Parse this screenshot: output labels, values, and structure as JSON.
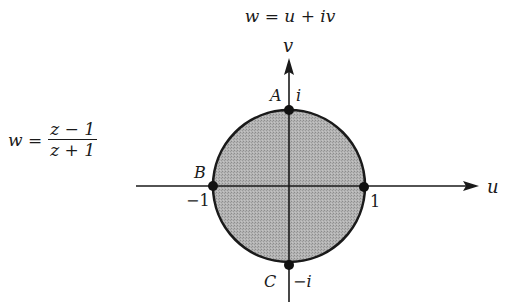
{
  "diagram": {
    "title": "w = u + iv",
    "mapping": {
      "lhs": "w =",
      "numerator": "z − 1",
      "denominator": "z + 1"
    },
    "axes": {
      "horizontal_label": "u",
      "vertical_label": "v"
    },
    "points": [
      {
        "name": "A",
        "value": "i",
        "position": "top"
      },
      {
        "name": "B",
        "value": "−1",
        "position": "left"
      },
      {
        "name": "C",
        "value": "−i",
        "position": "bottom"
      },
      {
        "name": "",
        "value": "1",
        "position": "right"
      }
    ],
    "region": {
      "description": "shaded unit disk",
      "fill_color": "#a8a8a8",
      "edge_color": "#1a1a1a"
    }
  }
}
